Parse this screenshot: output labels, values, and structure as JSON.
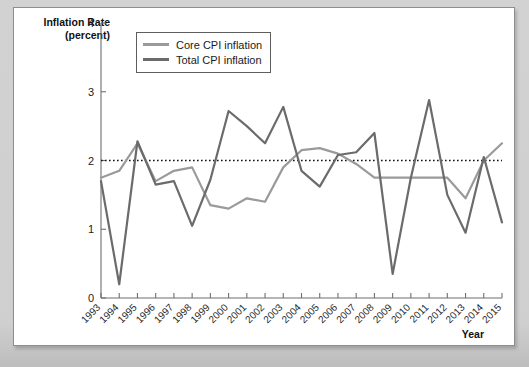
{
  "card": {
    "watermark_line1": "",
    "watermark_line2": ""
  },
  "legend": {
    "position": "top-left-inside",
    "items": [
      {
        "label": "Core CPI inflation",
        "color": "#9a9a9a"
      },
      {
        "label": "Total CPI inflation",
        "color": "#6b6b6b"
      }
    ]
  },
  "axis": {
    "y_title_line1": "Inflation Rate",
    "y_title_line2": "(percent)",
    "x_title": "Year",
    "y_ticks": [
      "0",
      "1",
      "2",
      "3",
      "4"
    ],
    "x_ticks": [
      "1993",
      "1994",
      "1995",
      "1996",
      "1997",
      "1998",
      "1999",
      "2000",
      "2001",
      "2002",
      "2003",
      "2004",
      "2005",
      "2006",
      "2007",
      "2008",
      "2009",
      "2010",
      "2011",
      "2012",
      "2013",
      "2014",
      "2015"
    ]
  },
  "reference": {
    "label": "2 percent target",
    "value": 2,
    "style": "dotted",
    "color": "#111111"
  },
  "chart_data": {
    "type": "line",
    "title": "",
    "subtitle": "",
    "xlabel": "Year",
    "ylabel": "Inflation Rate (percent)",
    "xlim": [
      1993,
      2015
    ],
    "ylim": [
      0,
      4
    ],
    "yticks": [
      0,
      1,
      2,
      3,
      4
    ],
    "grid": false,
    "legend_position": "upper left",
    "annotations": [
      {
        "type": "hline",
        "y": 2,
        "style": "dotted",
        "label": "2 percent inflation target"
      }
    ],
    "x": [
      1993,
      1994,
      1995,
      1996,
      1997,
      1998,
      1999,
      2000,
      2001,
      2002,
      2003,
      2004,
      2005,
      2006,
      2007,
      2008,
      2009,
      2010,
      2011,
      2012,
      2013,
      2014,
      2015
    ],
    "series": [
      {
        "name": "Core CPI inflation",
        "color": "#9a9a9a",
        "values": [
          1.75,
          1.85,
          2.25,
          1.7,
          1.85,
          1.9,
          1.35,
          1.3,
          1.45,
          1.4,
          1.9,
          2.15,
          2.18,
          2.1,
          1.95,
          1.75,
          1.75,
          1.75,
          1.75,
          1.75,
          1.45,
          2.0,
          2.25
        ]
      },
      {
        "name": "Total CPI inflation",
        "color": "#6b6b6b",
        "values": [
          1.7,
          0.2,
          2.28,
          1.65,
          1.7,
          1.05,
          1.72,
          2.72,
          2.5,
          2.25,
          2.78,
          1.85,
          1.62,
          2.08,
          2.12,
          2.4,
          0.35,
          1.75,
          2.88,
          1.5,
          0.95,
          2.05,
          1.1
        ]
      }
    ]
  }
}
